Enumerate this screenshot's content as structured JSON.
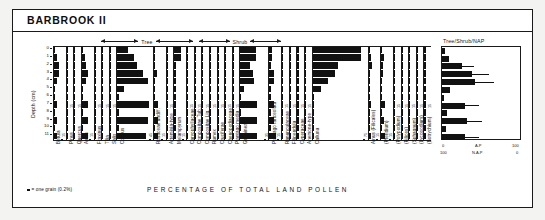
{
  "figure": {
    "title": "BARBROOK II",
    "caption": "PERCENTAGE OF TOTAL LAND POLLEN",
    "legend_symbol_note": "= one grain (0.2%)",
    "depth_axis_title": "Depth (cm)",
    "depth_ticks": [
      "0",
      "1",
      "2",
      "3",
      "4",
      "5",
      "6",
      "7",
      "8",
      "9",
      "10",
      "11"
    ],
    "group_headers": [
      {
        "label": "Tree"
      },
      {
        "label": "Shrub"
      }
    ],
    "summary_header": "Tree/Shrub/NAP",
    "summary_axis_top": {
      "left": "0",
      "mid": "A.P",
      "right": "100"
    },
    "summary_axis_bottom": {
      "left": "100",
      "mid": "N.A.P",
      "right": "0"
    }
  },
  "chart_data": {
    "type": "bar",
    "title": "BARBROOK II",
    "subtitle": "Pollen percentage diagram",
    "xlabel": "PERCENTAGE OF TOTAL LAND POLLEN",
    "ylabel": "Depth (cm)",
    "orientation": "horizontal-by-depth",
    "depths": [
      0,
      1,
      2,
      3,
      4,
      5,
      6,
      7,
      8,
      9,
      10,
      11
    ],
    "ylim": [
      0,
      11
    ],
    "grid": false,
    "legend_position": "bottom-left",
    "group_spans": [
      {
        "name": "Tree",
        "taxa_from": "Betula",
        "taxa_to": "Salix"
      },
      {
        "name": "Shrub",
        "taxa_from": "Salix",
        "taxa_to": "Corylus"
      }
    ],
    "series": [
      {
        "name": "Betula",
        "group": "Tree",
        "scale_max": 15,
        "scale_label": "15",
        "values": [
          2.0,
          4.5,
          7.0,
          6.5,
          5.0,
          1.5,
          0.8,
          4.5,
          1.0,
          4.0,
          0.8,
          4.2
        ]
      },
      {
        "name": "Pinus",
        "group": "Tree",
        "scale_max": 15,
        "scale_label": "15",
        "values": [
          0.4,
          0.4,
          0.4,
          0.4,
          0.4,
          0.4,
          0.4,
          0.4,
          0.4,
          0.4,
          0.4,
          0.4
        ]
      },
      {
        "name": "Quercus",
        "group": "Tree",
        "scale_max": 15,
        "scale_label": "15",
        "values": [
          0.4,
          0.4,
          0.4,
          0.4,
          0.4,
          0.4,
          0.4,
          0.4,
          0.4,
          0.4,
          0.4,
          0.4
        ]
      },
      {
        "name": "Alnus",
        "group": "Tree",
        "scale_max": 15,
        "scale_label": "15",
        "values": [
          1.5,
          4.0,
          6.0,
          8.0,
          6.5,
          2.0,
          0.8,
          9.0,
          0.8,
          8.0,
          0.8,
          8.0
        ]
      },
      {
        "name": "Fraxinus",
        "group": "Tree",
        "scale_max": 15,
        "scale_label": "15",
        "values": [
          0.4,
          0.4,
          0.4,
          0.4,
          0.4,
          0.4,
          0.4,
          0.4,
          0.4,
          0.4,
          0.4,
          0.4
        ]
      },
      {
        "name": "Tilia",
        "group": "Tree",
        "scale_max": 15,
        "scale_label": "15",
        "values": [
          0.4,
          0.4,
          0.4,
          0.4,
          0.4,
          0.4,
          0.4,
          0.4,
          0.4,
          0.4,
          0.4,
          0.4
        ]
      },
      {
        "name": "Salix",
        "group": "Shrub",
        "scale_max": 15,
        "scale_label": "15",
        "values": [
          0.4,
          0.4,
          0.4,
          0.4,
          0.4,
          0.4,
          0.4,
          0.4,
          0.4,
          0.4,
          0.4,
          0.4
        ]
      },
      {
        "name": "Corylus",
        "group": "Shrub",
        "scale_max": 45,
        "scale_label": "45",
        "values": [
          14.0,
          22.0,
          26.0,
          33.0,
          40.0,
          8.0,
          1.0,
          41.0,
          1.0,
          40.0,
          1.0,
          38.0
        ]
      },
      {
        "name": "Rosaceae undiff.",
        "group": "Herb",
        "scale_max": 15,
        "scale_label": "15",
        "values": [
          1.0,
          1.0,
          1.0,
          4.0,
          1.0,
          1.0,
          1.0,
          5.0,
          1.0,
          5.0,
          1.0,
          5.0
        ]
      },
      {
        "name": "Artemisia-type",
        "group": "Herb",
        "scale_max": 15,
        "scale_label": "15",
        "values": [
          0.4,
          0.4,
          0.4,
          0.4,
          0.4,
          0.4,
          0.4,
          0.4,
          0.4,
          0.4,
          0.4,
          0.4
        ]
      },
      {
        "name": "Melampyrum",
        "group": "Herb",
        "scale_max": 15,
        "scale_label": "15",
        "values": [
          10.0,
          10.0,
          1.0,
          1.0,
          0.8,
          0.8,
          0.8,
          0.8,
          0.8,
          0.8,
          0.8,
          0.8
        ]
      },
      {
        "name": "Caryophyllaceae",
        "group": "Herb",
        "scale_max": 15,
        "scale_label": "15",
        "values": [
          0.4,
          0.4,
          0.4,
          0.4,
          0.4,
          0.4,
          0.4,
          1.5,
          0.4,
          0.4,
          0.4,
          0.4
        ]
      },
      {
        "name": "Compositae Tub.",
        "group": "Herb",
        "scale_max": 15,
        "scale_label": "15",
        "values": [
          0.4,
          0.4,
          0.4,
          0.4,
          0.4,
          0.4,
          0.4,
          0.4,
          0.4,
          0.4,
          0.4,
          0.4
        ]
      },
      {
        "name": "Compositae Lig.",
        "group": "Herb",
        "scale_max": 15,
        "scale_label": "15",
        "values": [
          0.4,
          0.4,
          0.4,
          0.4,
          0.4,
          0.4,
          0.4,
          0.4,
          0.4,
          0.4,
          0.4,
          0.4
        ]
      },
      {
        "name": "Rumex",
        "group": "Herb",
        "scale_max": 15,
        "scale_label": "15",
        "values": [
          0.4,
          0.4,
          0.4,
          0.4,
          0.4,
          0.4,
          0.4,
          0.4,
          0.4,
          0.4,
          0.4,
          0.4
        ]
      },
      {
        "name": "Cruciferae",
        "group": "Herb",
        "scale_max": 15,
        "scale_label": "15",
        "values": [
          0.4,
          0.4,
          0.4,
          0.4,
          0.4,
          0.4,
          0.4,
          0.4,
          0.4,
          0.4,
          0.4,
          0.4
        ]
      },
      {
        "name": "Chenopodiaceae",
        "group": "Herb",
        "scale_max": 15,
        "scale_label": "15",
        "values": [
          0.4,
          0.4,
          0.4,
          0.4,
          0.4,
          0.4,
          0.4,
          0.4,
          0.4,
          0.4,
          0.4,
          0.4
        ]
      },
      {
        "name": "Plantago media",
        "group": "Herb",
        "scale_max": 15,
        "scale_label": "15",
        "values": [
          0.4,
          0.4,
          0.4,
          0.4,
          0.4,
          0.4,
          0.4,
          0.4,
          0.4,
          0.4,
          0.4,
          0.4
        ]
      },
      {
        "name": "Gramineae",
        "group": "Herb",
        "scale_max": 35,
        "scale_label": "35",
        "values": [
          20.0,
          20.0,
          13.0,
          16.0,
          18.0,
          5.0,
          1.0,
          22.0,
          1.0,
          22.0,
          1.0,
          22.0
        ]
      },
      {
        "name": "Plantago lanceolata",
        "group": "Herb",
        "scale_max": 15,
        "scale_label": "15",
        "values": [
          3.0,
          3.0,
          2.5,
          6.0,
          7.0,
          2.0,
          0.8,
          6.0,
          0.8,
          6.5,
          0.8,
          9.0
        ]
      },
      {
        "name": "Ranunculaceae",
        "group": "Herb",
        "scale_max": 15,
        "scale_label": "15",
        "values": [
          0.4,
          0.4,
          0.4,
          0.4,
          0.4,
          0.4,
          0.4,
          0.4,
          0.4,
          0.4,
          0.4,
          0.4
        ]
      },
      {
        "name": "Filipendula",
        "group": "Herb",
        "scale_max": 15,
        "scale_label": "15",
        "values": [
          0.4,
          0.4,
          0.4,
          0.4,
          0.4,
          0.4,
          0.4,
          0.4,
          0.4,
          0.4,
          0.4,
          0.4
        ]
      },
      {
        "name": "Cyperaceae",
        "group": "Herb",
        "scale_max": 15,
        "scale_label": "15",
        "values": [
          0.4,
          0.4,
          0.4,
          0.4,
          0.4,
          0.4,
          0.4,
          0.4,
          2.5,
          0.4,
          0.4,
          0.4
        ]
      },
      {
        "name": "Anemone-type",
        "group": "Herb",
        "scale_max": 15,
        "scale_label": "15",
        "values": [
          0.4,
          0.4,
          0.4,
          0.4,
          0.4,
          0.4,
          0.4,
          0.4,
          0.4,
          0.4,
          0.4,
          0.4
        ]
      },
      {
        "name": "Calluna",
        "group": "Dwarf shrub",
        "scale_max": 75,
        "scale_label": "75",
        "values": [
          68.0,
          68.0,
          36.0,
          32.0,
          22.0,
          12.0,
          0.5,
          0.5,
          0.5,
          0.5,
          0.5,
          0.5
        ]
      },
      {
        "name": "Alnus (Filicales)",
        "group": "Spore",
        "scale_max": 15,
        "scale_label": "15",
        "values": [
          1.5,
          4.0,
          4.5,
          2.5,
          2.0,
          1.0,
          0.8,
          3.0,
          0.8,
          2.5,
          0.8,
          3.0
        ]
      },
      {
        "name": "(Pteridium)",
        "group": "Spore",
        "scale_max": 15,
        "scale_label": "15",
        "values": [
          1.0,
          3.5,
          3.0,
          2.0,
          1.5,
          1.0,
          0.8,
          5.0,
          0.8,
          4.5,
          0.8,
          6.0
        ]
      },
      {
        "name": "(Polypodium)",
        "group": "Spore",
        "scale_max": 15,
        "scale_label": "15",
        "values": [
          0.4,
          0.4,
          0.4,
          0.4,
          0.4,
          0.4,
          0.4,
          1.5,
          0.4,
          0.4,
          0.4,
          0.4
        ]
      },
      {
        "name": "(Filices)",
        "group": "Spore",
        "scale_max": 15,
        "scale_label": "15",
        "values": [
          0.4,
          0.4,
          0.4,
          0.4,
          0.4,
          0.4,
          0.4,
          0.4,
          0.4,
          0.4,
          0.4,
          0.4
        ]
      },
      {
        "name": "(Sphagnum)",
        "group": "Spore",
        "scale_max": 15,
        "scale_label": "15",
        "values": [
          0.4,
          0.4,
          0.4,
          0.4,
          0.4,
          0.4,
          0.4,
          0.4,
          0.4,
          0.4,
          0.4,
          0.4
        ]
      },
      {
        "name": "(Lycopodium)",
        "group": "Spore",
        "scale_max": 15,
        "scale_label": "15",
        "values": [
          0.4,
          0.4,
          0.4,
          0.4,
          0.4,
          0.4,
          0.4,
          0.4,
          0.4,
          0.4,
          0.4,
          0.4
        ]
      },
      {
        "name": "(Botrychium)",
        "group": "Spore",
        "scale_max": 15,
        "scale_label": "15",
        "values": [
          0.4,
          0.4,
          0.4,
          0.4,
          0.4,
          0.4,
          0.4,
          0.4,
          0.4,
          0.4,
          0.4,
          0.4
        ]
      }
    ],
    "summary_panel": {
      "title": "Tree/Shrub/NAP",
      "xlim": [
        0,
        100
      ],
      "ap_values": [
        4,
        9,
        26,
        38,
        42,
        10,
        2,
        30,
        6,
        32,
        5,
        30
      ],
      "axis_top_left": "0",
      "axis_top_mid": "A.P",
      "axis_top_right": "100",
      "axis_bottom_left": "100",
      "axis_bottom_mid": "N.A.P",
      "axis_bottom_right": "0"
    }
  }
}
